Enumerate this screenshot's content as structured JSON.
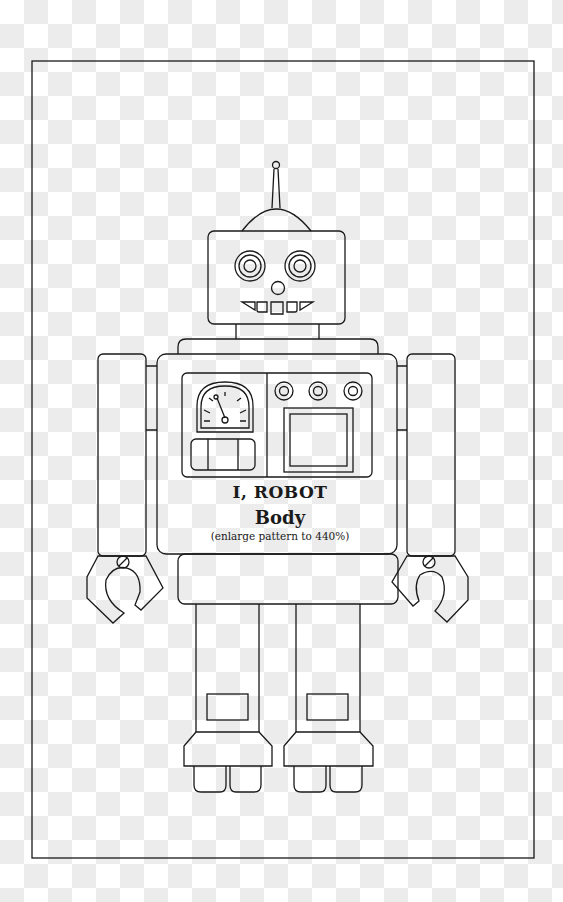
{
  "page": {
    "title": "I, ROBOT",
    "subtitle": "Body",
    "note": "(enlarge pattern to 440%)"
  },
  "colors": {
    "line": "#1a1a1a",
    "checker_light": "#ffffff",
    "checker_dark": "#ececec"
  },
  "parts": [
    "antenna",
    "dome",
    "head",
    "eyes",
    "nose",
    "teeth",
    "neck",
    "shoulder",
    "torso",
    "gauge",
    "control-knobs",
    "screen",
    "arms",
    "claws",
    "hips",
    "legs",
    "knee-panels",
    "boots",
    "feet"
  ]
}
